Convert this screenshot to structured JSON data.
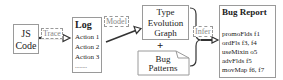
{
  "nodes": {
    "js_code": {
      "line1": "JS",
      "line2": "Code"
    },
    "log": {
      "title": "Log",
      "items": [
        "Action 1",
        "Action 2",
        "Action 3",
        "........"
      ]
    },
    "teg": {
      "line1": "Type",
      "line2": "Evolution",
      "line3": "Graph"
    },
    "plus": "+",
    "bug_patterns": {
      "line1": "Bug",
      "line2": "Patterns"
    },
    "bug_report": {
      "title": "Bug Report",
      "items": [
        "promoFlds f1",
        "ordFls f3, f4",
        "useMixin o5",
        "advFlds f5",
        "movMap f6, f7"
      ]
    }
  },
  "edges": {
    "trace": "Trace",
    "model": "Model",
    "infer": "Infer"
  }
}
